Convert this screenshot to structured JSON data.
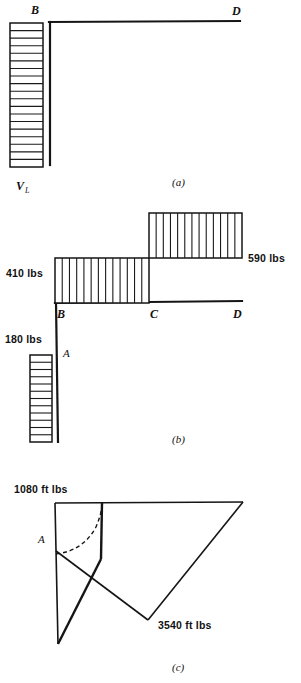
{
  "figure": {
    "panels": [
      {
        "id": "a",
        "caption": "(a)",
        "caption_x": 172,
        "caption_y": 186,
        "labels": [
          {
            "name": "node-b",
            "text": "B",
            "x": 31,
            "y": 14
          },
          {
            "name": "node-d",
            "text": "D",
            "x": 232,
            "y": 15
          },
          {
            "name": "reaction-vl",
            "text": "V",
            "sub": "L",
            "x": 16,
            "y": 190
          }
        ],
        "frame": {
          "vertical": {
            "x": 50,
            "y_top": 22,
            "y_bottom": 165
          },
          "horizontal": {
            "y": 22,
            "x_left": 50,
            "x_right": 240
          }
        },
        "hatch_block": {
          "name": "distributed-load-block-a",
          "x": 10,
          "y": 23,
          "width": 33,
          "height": 144,
          "orientation": "horizontal",
          "divisions": 19
        }
      },
      {
        "id": "b",
        "caption": "(b)",
        "caption_x": 172,
        "caption_y": 443,
        "labels": [
          {
            "name": "shear-590",
            "text": "590 lbs",
            "x": 248,
            "y": 262
          },
          {
            "name": "shear-410",
            "text": "410 lbs",
            "x": 6,
            "y": 277
          },
          {
            "name": "shear-180",
            "text": "180 lbs",
            "x": 5,
            "y": 343
          },
          {
            "name": "node-b",
            "text": "B",
            "x": 57,
            "y": 318
          },
          {
            "name": "node-c",
            "text": "C",
            "x": 150,
            "y": 318
          },
          {
            "name": "node-d",
            "text": "D",
            "x": 233,
            "y": 318
          },
          {
            "name": "node-a",
            "text": "A",
            "x": 63,
            "y": 357
          }
        ],
        "baseline": {
          "horizontal": {
            "y": 303,
            "x_left": 55,
            "x_right": 242
          },
          "vertical": {
            "x": 56,
            "y_top": 303,
            "y_bottom": 442
          }
        },
        "bars": [
          {
            "name": "shear-bar-bc",
            "value": "410 lbs",
            "x": 55,
            "y": 258,
            "width": 94,
            "height": 45,
            "orientation": "vertical",
            "divisions": 13
          },
          {
            "name": "shear-bar-cd",
            "value": "590 lbs",
            "x": 149,
            "y": 213,
            "width": 93,
            "height": 45,
            "orientation": "vertical",
            "divisions": 13
          },
          {
            "name": "shear-bar-ab",
            "value": "180 lbs",
            "x": 30,
            "y": 355,
            "width": 22,
            "height": 87,
            "orientation": "horizontal",
            "divisions": 12
          }
        ]
      },
      {
        "id": "c",
        "caption": "(c)",
        "caption_x": 172,
        "caption_y": 671,
        "labels": [
          {
            "name": "moment-1080",
            "text": "1080 ft lbs",
            "x": 14,
            "y": 493
          },
          {
            "name": "moment-3540",
            "text": "3540 ft lbs",
            "x": 158,
            "y": 629
          },
          {
            "name": "node-a",
            "text": "A",
            "x": 38,
            "y": 543
          }
        ],
        "outline": {
          "top_left": [
            55,
            503
          ],
          "top_right": [
            243,
            503
          ],
          "inner_top": [
            103,
            503
          ],
          "inner_bottom": [
            101,
            559
          ],
          "point_a": [
            56,
            551
          ],
          "bottom_vertex": [
            58,
            644
          ],
          "right_low": [
            148,
            620
          ]
        },
        "dashed_curve": "arc from A curving up to inner top"
      }
    ],
    "colors": {
      "ink": "#151515",
      "paper": "#ffffff"
    }
  }
}
